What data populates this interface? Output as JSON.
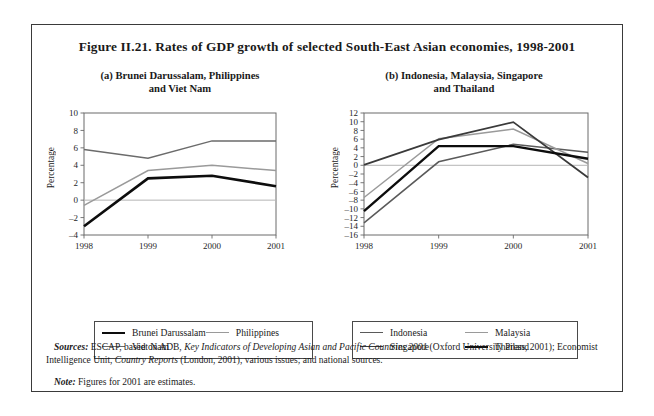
{
  "figure": {
    "title": "Figure II.21.  Rates of GDP growth of selected South-East Asian economies, 1998-2001"
  },
  "panel_a": {
    "title_line1": "(a)   Brunei Darussalam, Philippines",
    "title_line2": "and Viet Nam",
    "ylabel": "Percentage",
    "legend": [
      {
        "label": "Brunei Darussalam",
        "color": "#0d0d0d",
        "width": 2.6
      },
      {
        "label": "Philippines",
        "color": "#9a9a9a",
        "width": 1.5
      },
      {
        "label": "Viet Nam",
        "color": "#6b6b6b",
        "width": 1.5
      }
    ]
  },
  "panel_b": {
    "title_line1": "(b)   Indonesia, Malaysia, Singapore",
    "title_line2": "and Thailand",
    "ylabel": "Percentage",
    "legend": [
      {
        "label": "Indonesia",
        "color": "#5a5a5a",
        "width": 1.5
      },
      {
        "label": "Malaysia",
        "color": "#9a9a9a",
        "width": 1.5
      },
      {
        "label": "Singapore",
        "color": "#3a3a3a",
        "width": 1.8
      },
      {
        "label": "Thailand",
        "color": "#0d0d0d",
        "width": 2.4
      }
    ]
  },
  "notes": {
    "sources_label": "Sources:",
    "sources_text_1": "ESCAP, based on ADB, ",
    "sources_italic_1": "Key Indicators of Developing Asian and Pacific Countries 2001",
    "sources_text_2": " (Oxford University Press, 2001); Economist Intelligence Unit, ",
    "sources_italic_2": "Country Reports",
    "sources_text_3": " (London, 2001), various issues; and national sources.",
    "note_label": "Note:",
    "note_text": "Figures for 2001 are estimates."
  },
  "chart_data": [
    {
      "type": "line",
      "panel": "a",
      "title": "(a) Brunei Darussalam, Philippines and Viet Nam",
      "xlabel": "",
      "ylabel": "Percentage",
      "x": [
        "1998",
        "1999",
        "2000",
        "2001"
      ],
      "xticks": [
        "1998",
        "1999",
        "2000",
        "2001"
      ],
      "yticks": [
        -4,
        -2,
        0,
        2,
        4,
        6,
        8,
        10
      ],
      "ylim": [
        -4,
        10
      ],
      "grid": false,
      "zero_line": true,
      "legend_position": "below",
      "series": [
        {
          "name": "Brunei Darussalam",
          "values": [
            -3.0,
            2.5,
            2.8,
            1.6
          ],
          "color": "#0d0d0d"
        },
        {
          "name": "Philippines",
          "values": [
            -0.6,
            3.4,
            4.0,
            3.4
          ],
          "color": "#9a9a9a"
        },
        {
          "name": "Viet Nam",
          "values": [
            5.8,
            4.8,
            6.8,
            6.8
          ],
          "color": "#6b6b6b"
        }
      ]
    },
    {
      "type": "line",
      "panel": "b",
      "title": "(b) Indonesia, Malaysia, Singapore and Thailand",
      "xlabel": "",
      "ylabel": "Percentage",
      "x": [
        "1998",
        "1999",
        "2000",
        "2001"
      ],
      "xticks": [
        "1998",
        "1999",
        "2000",
        "2001"
      ],
      "yticks": [
        -16,
        -14,
        -12,
        -10,
        -8,
        -6,
        -4,
        -2,
        0,
        2,
        4,
        6,
        8,
        10,
        12
      ],
      "ylim": [
        -16,
        12
      ],
      "grid": false,
      "zero_line": true,
      "legend_position": "below",
      "series": [
        {
          "name": "Indonesia",
          "values": [
            -13.2,
            0.8,
            4.8,
            3.0
          ],
          "color": "#5a5a5a"
        },
        {
          "name": "Malaysia",
          "values": [
            -7.4,
            6.1,
            8.3,
            0.4
          ],
          "color": "#9a9a9a"
        },
        {
          "name": "Singapore",
          "values": [
            0.1,
            5.9,
            9.9,
            -2.8
          ],
          "color": "#3a3a3a"
        },
        {
          "name": "Thailand",
          "values": [
            -10.5,
            4.4,
            4.4,
            1.5
          ],
          "color": "#0d0d0d"
        }
      ]
    }
  ]
}
